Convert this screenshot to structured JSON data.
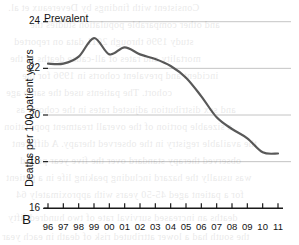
{
  "figure": {
    "panel_letter": "B",
    "background_color": "#ffffff"
  },
  "chart_data": {
    "type": "line",
    "title": "Prevalent",
    "xlabel": "",
    "ylabel": "Deaths per 100 patient years",
    "categories": [
      "96",
      "97",
      "98",
      "99",
      "00",
      "01",
      "02",
      "03",
      "04",
      "05",
      "06",
      "07",
      "08",
      "09",
      "10",
      "11"
    ],
    "values": [
      22.2,
      22.2,
      22.5,
      23.3,
      22.6,
      22.9,
      22.6,
      22.4,
      22.1,
      21.6,
      20.8,
      19.9,
      19.4,
      19.0,
      18.4,
      18.35
    ],
    "series": [
      {
        "name": "Prevalent",
        "color": "#595959",
        "values": [
          22.2,
          22.2,
          22.5,
          23.3,
          22.6,
          22.9,
          22.6,
          22.4,
          22.1,
          21.6,
          20.8,
          19.9,
          19.4,
          19.0,
          18.4,
          18.35
        ]
      }
    ],
    "ylim": [
      16,
      24
    ],
    "yticks": [
      16,
      18,
      20,
      22,
      24
    ],
    "ytick_labels": [
      "16",
      "18",
      "20",
      "22",
      "24"
    ],
    "xlim_categories": [
      "96",
      "11"
    ],
    "grid": "horizontal",
    "grid_color": "#b5b5b5",
    "legend": "none",
    "axis_color": "#1a1a1a",
    "line_width": 2.2,
    "smoothing": "smooth"
  },
  "ghost_text": {
    "lines": [
      "Consistent with findings by Devereaux et al.",
      "and other comparable population studies the",
      "study 1996 through 2011 data on reported",
      "mortality and rates of all-cause deaths in the",
      "incident and prevalent cohorts in 1996 for the",
      "cohort. The patients used the same age",
      "and sex distribution adjusted rates in the cohorts as",
      "a sizeable portion of the overall treatment population",
      "the available registry in the observed therapy. A different",
      "observed therapy standard over the five year period",
      "was usually the hazard including peaking life in a patient",
      "for a patient aged 45-50 years with approximately 64",
      "deaths an increased survival rate of two hundred fifty",
      "the south had a lower attributed risk of death in each year"
    ]
  }
}
